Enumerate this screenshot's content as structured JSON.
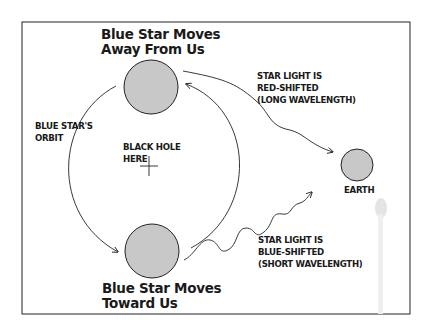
{
  "diagram": {
    "colors": {
      "body_fill": "#c8c8c8",
      "stroke": "#222222",
      "frame": "#222222"
    },
    "top_star": {
      "label_line1": "Blue Star Moves",
      "label_line2": "Away From Us"
    },
    "bottom_star": {
      "label_line1": "Blue Star Moves",
      "label_line2": "Toward Us"
    },
    "orbit_label": {
      "line1": "BLUE STAR'S",
      "line2": "ORBIT"
    },
    "black_hole_label": {
      "line1": "BLACK HOLE",
      "line2": "HERE"
    },
    "red_shift_label": {
      "line1": "STAR LIGHT IS",
      "line2": "RED-SHIFTED",
      "line3": "(LONG WAVELENGTH)"
    },
    "blue_shift_label": {
      "line1": "STAR LIGHT IS",
      "line2": "BLUE-SHIFTED",
      "line3": "(SHORT WAVELENGTH)"
    },
    "earth_label": "EARTH"
  }
}
